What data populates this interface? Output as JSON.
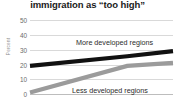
{
  "chart": {
    "title": "immigration as “too high”",
    "ylabel": "Percent"
  },
  "labels": {
    "more": "More developed regions",
    "less": "Less developed regions"
  },
  "ticks": {
    "t50": "50",
    "t40": "40",
    "t30": "30",
    "t20": "20",
    "t10": "10",
    "t0": "0"
  },
  "chart_data": {
    "type": "line",
    "title": "immigration as “too high”",
    "xlabel": "",
    "ylabel": "Percent",
    "ylim": [
      0,
      50
    ],
    "yticks": [
      0,
      10,
      20,
      30,
      40,
      50
    ],
    "grid": true,
    "legend": "inline-labels",
    "x": [
      0,
      0.68,
      1
    ],
    "series": [
      {
        "name": "More developed regions",
        "color": "#111111",
        "values": [
          19,
          25.5,
          29
        ]
      },
      {
        "name": "Less developed regions",
        "color": "#9b9b9b",
        "values": [
          1,
          19,
          21
        ]
      }
    ]
  },
  "colors": {
    "more_developed": "#111111",
    "less_developed": "#9b9b9b",
    "grid": "#d9d9d9",
    "text": "#231f20"
  }
}
